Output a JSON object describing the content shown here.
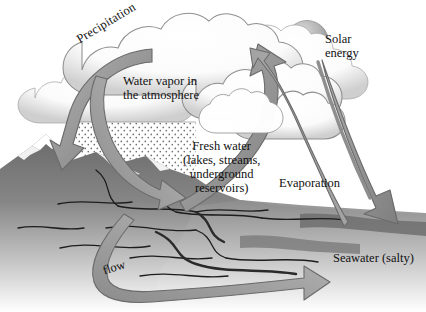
{
  "diagram": {
    "type": "water-cycle-schematic",
    "palette": {
      "background": "#ffffff",
      "ink": "#111111",
      "arrow_fill": "#9b9b9b",
      "arrow_fill_dark": "#818181",
      "arrow_outline": "#5d5d5d",
      "cloud_fill": "#ffffff",
      "cloud_shadow": "#c9c9c9",
      "cloud_outline": "#8c8c8c",
      "terrain_dark": "#6e6e6e",
      "terrain_light": "#ffffff",
      "water_mid": "#8a8a8a",
      "sun_light": "#d3d3d3",
      "sun_dark": "#8e8e8e",
      "rain_stipple": "#6f6f6f",
      "snow": "#ffffff"
    },
    "labels": {
      "precipitation": "Precipitation",
      "water_vapor": "Water vapor in\nthe atmosphere",
      "fresh_water": "Fresh water\n(lakes, streams,\nunderground\nreservoirs)",
      "solar_energy": "Solar\nenergy",
      "evaporation": "Evaporation",
      "seawater": "Seawater (salty)",
      "flow": "flow"
    },
    "elements": {
      "sun": "solar-disc",
      "clouds": "cumulus-cloud-bank",
      "mountain": "snow-capped-mountain",
      "rain": "rain-stipple-field",
      "ocean": "sea-surface",
      "river": "river-channels"
    },
    "flows": [
      {
        "name": "precipitation-arrow",
        "from": "clouds",
        "to": "mountain",
        "direction": "down-left"
      },
      {
        "name": "runoff-arrow",
        "from": "mountain",
        "to": "fresh-water",
        "direction": "down-right"
      },
      {
        "name": "evaporation-from-land-arrow",
        "from": "fresh-water",
        "to": "clouds",
        "direction": "up-right"
      },
      {
        "name": "evaporation-from-sea-arrow",
        "from": "seawater",
        "to": "clouds",
        "direction": "up-left"
      },
      {
        "name": "solar-energy-arrow",
        "from": "sun",
        "to": "seawater",
        "direction": "down-right"
      },
      {
        "name": "flow-arrow",
        "from": "fresh-water",
        "to": "seawater",
        "direction": "right"
      }
    ]
  }
}
